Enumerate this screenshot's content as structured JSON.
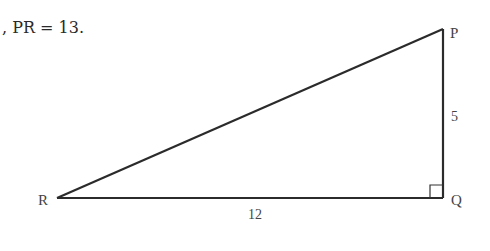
{
  "statement": {
    "text": ", PR = 13."
  },
  "triangle": {
    "vertices": {
      "P": {
        "label": "P",
        "x": 443,
        "y": 29
      },
      "Q": {
        "label": "Q",
        "x": 443,
        "y": 198
      },
      "R": {
        "label": "R",
        "x": 57,
        "y": 198
      }
    },
    "sides": {
      "PQ": {
        "label": "5"
      },
      "RQ": {
        "label": "12"
      },
      "PR": {
        "label": "13"
      }
    },
    "right_angle_at": "Q",
    "stroke_color": "#2b2b2b"
  }
}
